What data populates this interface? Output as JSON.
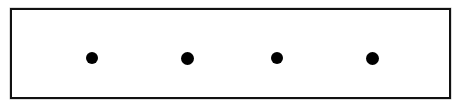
{
  "figure": {
    "type": "dot-row-diagram",
    "canvas": {
      "width": 459,
      "height": 109,
      "background": "#ffffff"
    },
    "frame": {
      "label": "rectangular-border",
      "x": 10,
      "y": 8,
      "width": 441,
      "height": 91,
      "border_width": 2,
      "border_color": "#111111",
      "fill": "#ffffff"
    },
    "markers": {
      "count": 4,
      "shape": "filled-circle",
      "color": "#000000",
      "items": [
        {
          "label": "dot-1",
          "cx": 92,
          "cy": 58,
          "diameter": 12
        },
        {
          "label": "dot-2",
          "cx": 187,
          "cy": 58,
          "diameter": 13
        },
        {
          "label": "dot-3",
          "cx": 277,
          "cy": 58,
          "diameter": 12
        },
        {
          "label": "dot-4",
          "cx": 372,
          "cy": 58,
          "diameter": 13
        }
      ]
    }
  }
}
